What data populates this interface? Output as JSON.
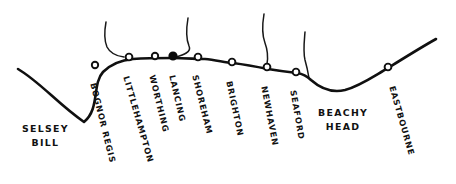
{
  "map": {
    "title": "Sussex coastline sketch map",
    "stroke_color": "#101010",
    "background_color": "#ffffff",
    "coast_line_width": 2.6,
    "coastline_points": "M 18,69 C 40,82 58,104 84,122 C 100,109 92,84 103,72 C 112,63 122,60 133,59 C 147,58 160,58 172,58 C 186,58 196,59 205,59 C 215,60 224,62 233,63 C 248,65 258,67 268,69 C 280,71 288,72 297,73 C 304,74 308,77 311,80 C 320,88 332,93 345,90 C 360,86 374,76 388,68 C 404,58 420,48 436,39",
    "rivers": [
      {
        "name": "river-arun",
        "path": "M 106,22 C 104,33 104,40 107,47 C 110,53 116,56 124,57"
      },
      {
        "name": "river-adur",
        "path": "M 188,18 C 186,30 186,39 189,46 C 192,52 183,55 176,57"
      },
      {
        "name": "river-ouse",
        "path": "M 264,14 C 262,26 262,35 265,43 C 268,51 268,58 267,64"
      },
      {
        "name": "river-cuckmere",
        "path": "M 305,32 C 304,44 303,52 305,60 C 307,67 308,72 309,78"
      }
    ],
    "towns": [
      {
        "name": "bognor-regis",
        "label": "BOGNOR REGIS",
        "cx": 95,
        "cy": 65,
        "r": 3.2,
        "filled": false,
        "label_x": 93,
        "label_y": 79,
        "angle": 76
      },
      {
        "name": "littlehampton",
        "label": "LITTLEHAMPTON",
        "cx": 129,
        "cy": 57,
        "r": 3.4,
        "filled": false,
        "label_x": 126,
        "label_y": 72,
        "angle": 74
      },
      {
        "name": "worthing",
        "label": "WORTHING",
        "cx": 155,
        "cy": 56,
        "r": 3.2,
        "filled": false,
        "label_x": 152,
        "label_y": 71,
        "angle": 76
      },
      {
        "name": "lancing",
        "label": "LANCING",
        "cx": 173,
        "cy": 56,
        "r": 3.8,
        "filled": true,
        "label_x": 172,
        "label_y": 71,
        "angle": 77
      },
      {
        "name": "shoreham",
        "label": "SHOREHAM",
        "cx": 198,
        "cy": 57,
        "r": 3.4,
        "filled": false,
        "label_x": 195,
        "label_y": 71,
        "angle": 76
      },
      {
        "name": "brighton",
        "label": "BRIGHTON",
        "cx": 232,
        "cy": 62,
        "r": 3.4,
        "filled": false,
        "label_x": 229,
        "label_y": 77,
        "angle": 78
      },
      {
        "name": "newhaven",
        "label": "NEWHAVEN",
        "cx": 267,
        "cy": 67,
        "r": 3.4,
        "filled": false,
        "label_x": 264,
        "label_y": 82,
        "angle": 79
      },
      {
        "name": "seaford",
        "label": "SEAFORD",
        "cx": 296,
        "cy": 72,
        "r": 3.4,
        "filled": false,
        "label_x": 293,
        "label_y": 86,
        "angle": 80
      },
      {
        "name": "eastbourne",
        "label": "EASTBOURNE",
        "cx": 388,
        "cy": 67,
        "r": 3.4,
        "filled": false,
        "label_x": 392,
        "label_y": 82,
        "angle": 74
      }
    ],
    "area_labels": [
      {
        "name": "selsey-bill",
        "line1": "SELSEY",
        "line2": "BILL",
        "x": 22,
        "y": 122
      },
      {
        "name": "beachy-head",
        "line1": "BEACHY",
        "line2": "HEAD",
        "x": 318,
        "y": 106
      }
    ]
  }
}
